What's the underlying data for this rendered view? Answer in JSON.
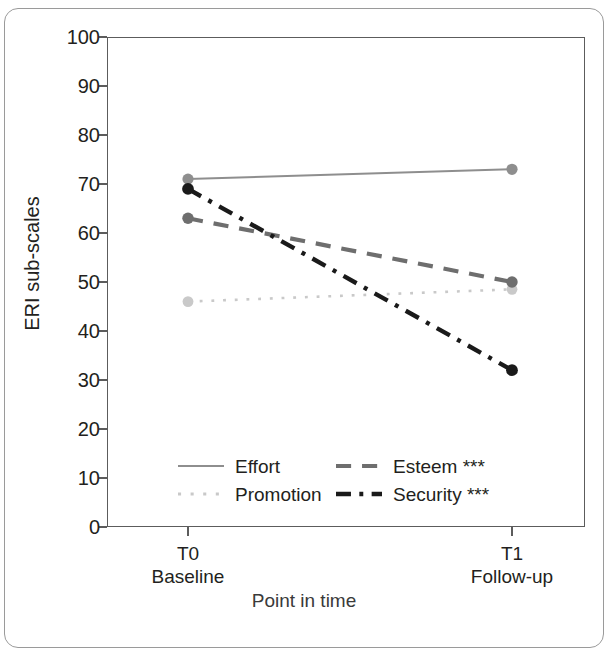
{
  "chart_data": {
    "type": "line",
    "title": "",
    "xlabel": "Point in time",
    "ylabel": "ERI sub-scales",
    "categories": [
      "T0",
      "T1"
    ],
    "category_sublabels": [
      "Baseline",
      "Follow-up"
    ],
    "ylim": [
      0,
      100
    ],
    "yticks": [
      0,
      10,
      20,
      30,
      40,
      50,
      60,
      70,
      80,
      90,
      100
    ],
    "grid": false,
    "legend_position": "inside-bottom",
    "series": [
      {
        "name": "Effort",
        "legend_label": "Effort",
        "values": [
          71,
          73
        ],
        "color": "#8e8e8e",
        "linestyle": "solid"
      },
      {
        "name": "Promotion",
        "legend_label": "Promotion",
        "values": [
          46,
          48.5
        ],
        "color": "#c9c9c9",
        "linestyle": "dotted"
      },
      {
        "name": "Esteem",
        "legend_label": "Esteem ***",
        "values": [
          63,
          50
        ],
        "color": "#6e6e6e",
        "linestyle": "dashed"
      },
      {
        "name": "Security",
        "legend_label": "Security ***",
        "values": [
          69,
          32
        ],
        "color": "#1a1a1a",
        "linestyle": "dashdot"
      }
    ]
  },
  "axis": {
    "y_title": "ERI sub-scales",
    "x_title": "Point in time",
    "y_ticks": [
      "100",
      "90",
      "80",
      "70",
      "60",
      "50",
      "40",
      "30",
      "20",
      "10",
      "0"
    ],
    "x_ticks": [
      {
        "label": "T0",
        "sublabel": "Baseline"
      },
      {
        "label": "T1",
        "sublabel": "Follow-up"
      }
    ]
  },
  "legend": {
    "items": [
      {
        "label": "Effort",
        "style": "solid",
        "color": "#8e8e8e"
      },
      {
        "label": "Esteem ***",
        "style": "dashed",
        "color": "#6e6e6e"
      },
      {
        "label": "Promotion",
        "style": "dotted",
        "color": "#c9c9c9"
      },
      {
        "label": "Security ***",
        "style": "dashdot",
        "color": "#1a1a1a"
      }
    ]
  }
}
